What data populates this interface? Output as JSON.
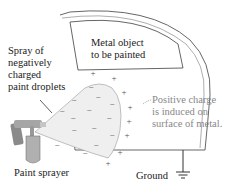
{
  "labels": {
    "spray": [
      "Spray of",
      "negatively",
      "charged",
      "paint droplets"
    ],
    "metal": [
      "Metal object",
      "to be painted"
    ],
    "positive": [
      "Positive charge",
      "is induced on",
      "surface of metal."
    ],
    "sprayer": "Paint sprayer",
    "ground": "Ground"
  },
  "charges": {
    "negative_symbol": "−",
    "positive_symbol": "+",
    "negative_count": 14,
    "positive_count": 8
  },
  "colors": {
    "outline": "#555555",
    "spray_fill": "#efefef",
    "positive_text": "#888888",
    "sprayer_body": "#9a9a9a"
  }
}
